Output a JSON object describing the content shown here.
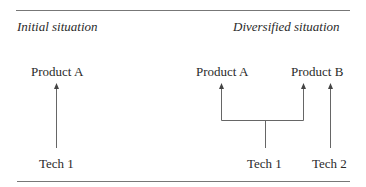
{
  "headings": {
    "left": "Initial situation",
    "right": "Diversified situation"
  },
  "initial": {
    "product": "Product A",
    "tech": "Tech 1"
  },
  "diversified": {
    "products": [
      "Product A",
      "Product B"
    ],
    "techs": [
      "Tech 1",
      "Tech 2"
    ]
  },
  "colors": {
    "line": "#555555",
    "text": "#2a2a2a"
  }
}
